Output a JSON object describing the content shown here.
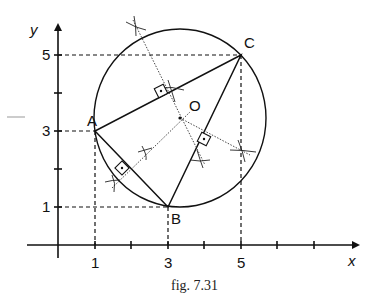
{
  "figure": {
    "caption": "fig. 7.31",
    "axes": {
      "x_label": "x",
      "y_label": "y",
      "x_ticks": [
        "1",
        "3",
        "5"
      ],
      "y_ticks": [
        "1",
        "3",
        "5"
      ]
    },
    "points": {
      "A": {
        "label": "A",
        "x": 1,
        "y": 3
      },
      "B": {
        "label": "B",
        "x": 3,
        "y": 1
      },
      "C": {
        "label": "C",
        "x": 5,
        "y": 5
      },
      "O": {
        "label": "O",
        "x": 3.33,
        "y": 3.33
      }
    }
  }
}
